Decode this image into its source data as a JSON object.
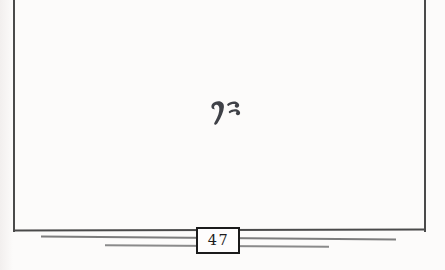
{
  "page": {
    "kind": "scanned book page (end of chapter, otherwise blank)",
    "page_number": "47",
    "ornament": "fleuron-chapter-end-ornament"
  },
  "colors": {
    "paper": "#fcfbfa",
    "paper_edge": "#f2efee",
    "frame": "#4a4a4a",
    "rule": "#7d7d7d",
    "rule2": "#8a8a8a",
    "box_border": "#1b1b1b",
    "box_fill": "#fefdfd",
    "ink": "#1e1e1e",
    "ornament": "#3f4147"
  }
}
